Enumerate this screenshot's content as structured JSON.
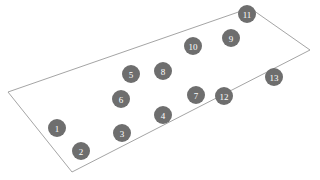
{
  "canvas": {
    "width": 320,
    "height": 180,
    "background_color": "#ffffff"
  },
  "diagram": {
    "shape": {
      "name": "parallelogram-outline",
      "type": "quadrilateral",
      "stroke_color": "#9a9a9a",
      "fill_color": "none",
      "stroke_width": 0.9,
      "points": "8,92 250,8 310,50 72,172",
      "vertices": [
        {
          "label": "left-corner",
          "x": 8,
          "y": 92
        },
        {
          "label": "top-corner",
          "x": 250,
          "y": 8
        },
        {
          "label": "right-corner",
          "x": 310,
          "y": 50
        },
        {
          "label": "bottom-corner",
          "x": 72,
          "y": 172
        }
      ]
    },
    "node_style": {
      "fill_color": "#6e6e6e",
      "text_color": "#ffffff",
      "radius": 9,
      "font_size": 9
    },
    "nodes": [
      {
        "id": "node-1",
        "label": "1",
        "x": 57,
        "y": 128
      },
      {
        "id": "node-2",
        "label": "2",
        "x": 81,
        "y": 151
      },
      {
        "id": "node-3",
        "label": "3",
        "x": 122,
        "y": 133
      },
      {
        "id": "node-4",
        "label": "4",
        "x": 163,
        "y": 115
      },
      {
        "id": "node-5",
        "label": "5",
        "x": 131,
        "y": 74
      },
      {
        "id": "node-6",
        "label": "6",
        "x": 121,
        "y": 99
      },
      {
        "id": "node-7",
        "label": "7",
        "x": 196,
        "y": 95
      },
      {
        "id": "node-8",
        "label": "8",
        "x": 163,
        "y": 71
      },
      {
        "id": "node-9",
        "label": "9",
        "x": 231,
        "y": 38
      },
      {
        "id": "node-10",
        "label": "10",
        "x": 193,
        "y": 46
      },
      {
        "id": "node-11",
        "label": "11",
        "x": 247,
        "y": 14
      },
      {
        "id": "node-12",
        "label": "12",
        "x": 224,
        "y": 96
      },
      {
        "id": "node-13",
        "label": "13",
        "x": 274,
        "y": 77
      }
    ]
  }
}
